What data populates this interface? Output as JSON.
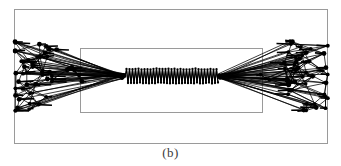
{
  "figure": {
    "caption": "(b)",
    "panel_label": "(b)",
    "title": "",
    "background_color": "#ffffff",
    "frame_color": "#9a9a9a",
    "graph_color": "#000000"
  },
  "chart_data": {
    "type": "diagram",
    "title": "",
    "subtitle": "",
    "xlabel": "",
    "ylabel": "",
    "caption": "(b)",
    "grid": false,
    "legend": null,
    "axis_ranges": {
      "x": [
        0,
        341
      ],
      "y": [
        0,
        166
      ]
    },
    "elements": {
      "outer_frame": {
        "x": 14,
        "y": 9,
        "width": 313,
        "height": 134,
        "stroke": "#9a9a9a",
        "stroke_width": 1
      },
      "inner_frame": {
        "x": 80,
        "y": 48,
        "width": 182,
        "height": 64,
        "stroke": "#9a9a9a",
        "stroke_width": 1
      }
    },
    "clusters": [
      {
        "name": "left-cluster",
        "hub": {
          "x": 125,
          "y": 76
        },
        "node_count": 40,
        "x_range": [
          15,
          60
        ],
        "y_range": [
          43,
          112
        ]
      },
      {
        "name": "right-cluster",
        "hub": {
          "x": 218,
          "y": 76
        },
        "node_count": 40,
        "x_range": [
          283,
          328
        ],
        "y_range": [
          43,
          112
        ]
      }
    ],
    "chain": {
      "name": "center-chain",
      "start": {
        "x": 125,
        "y": 76
      },
      "end": {
        "x": 218,
        "y": 76
      },
      "zigzag_count": 31,
      "amplitude": 7,
      "node_marker": "dot"
    },
    "node_marker": {
      "shape": "circle",
      "radius": 1.9,
      "fill": "#000000"
    },
    "edge_style": {
      "stroke": "#000000",
      "stroke_width": 0.75
    }
  }
}
